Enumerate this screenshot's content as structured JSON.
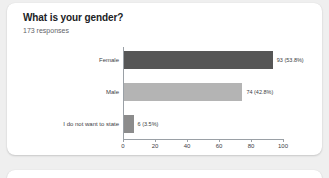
{
  "card": {
    "title": "What is your gender?",
    "responses": "173 responses"
  },
  "chart_data": {
    "type": "bar",
    "orientation": "horizontal",
    "title": "What is your gender?",
    "subtitle": "173 responses",
    "categories": [
      "Female",
      "Male",
      "I do not want to state"
    ],
    "values": [
      93,
      74,
      6
    ],
    "percents": [
      "53.8%",
      "42.8%",
      "3.5%"
    ],
    "data_labels": [
      "93 (53.8%)",
      "74 (42.8%)",
      "6 (3.5%)"
    ],
    "bar_colors": [
      "#565656",
      "#b4b4b4",
      "#8c8c8c"
    ],
    "xlabel": "",
    "ylabel": "",
    "xlim": [
      0,
      100
    ],
    "xticks": [
      0,
      20,
      40,
      60,
      80,
      100
    ],
    "xtick_labels": [
      "0",
      "20",
      "40",
      "60",
      "80",
      "100"
    ],
    "grid": false,
    "legend": false,
    "total_responses": 173
  }
}
